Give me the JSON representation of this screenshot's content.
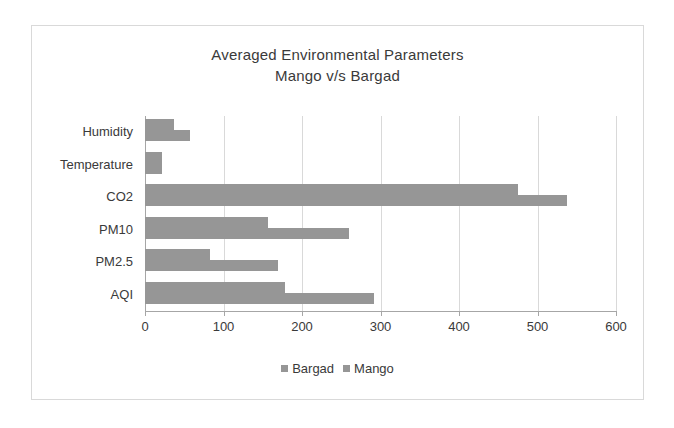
{
  "chart_data": {
    "type": "bar",
    "orientation": "horizontal",
    "title": "Averaged Environmental Parameters",
    "subtitle": "Mango v/s Bargad",
    "xlabel": "",
    "ylabel": "",
    "xlim": [
      0,
      600
    ],
    "xticks": [
      0,
      100,
      200,
      300,
      400,
      500,
      600
    ],
    "grid": true,
    "legend_position": "bottom",
    "categories": [
      "Humidity",
      "Temperature",
      "CO2",
      "PM10",
      "PM2.5",
      "AQI"
    ],
    "series": [
      {
        "name": "Bargad",
        "color": "#969696",
        "values": [
          37,
          22,
          475,
          157,
          83,
          178
        ]
      },
      {
        "name": "Mango",
        "color": "#969696",
        "values": [
          57,
          22,
          538,
          260,
          169,
          292
        ]
      }
    ]
  },
  "axis": {
    "tick_labels": [
      "0",
      "100",
      "200",
      "300",
      "400",
      "500",
      "600"
    ]
  },
  "legend": {
    "items": [
      {
        "label": "Bargad",
        "swatch": "legend-swatch-icon"
      },
      {
        "label": "Mango",
        "swatch": "legend-swatch-icon"
      }
    ]
  },
  "colors": {
    "bar": "#969696",
    "grid": "#d9d9d9",
    "axis": "#a6a6a6",
    "text": "#3a3a3a",
    "frame": "#d9d9d9",
    "background": "#ffffff"
  }
}
